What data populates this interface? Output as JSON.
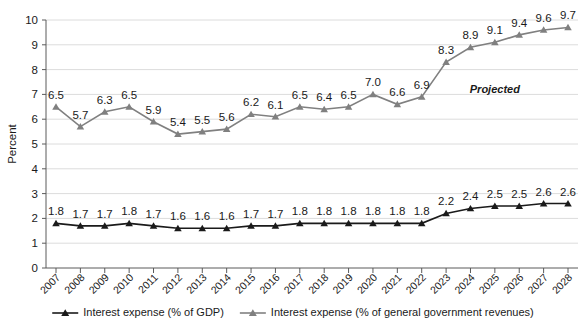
{
  "chart_data": {
    "type": "line",
    "title": "",
    "xlabel": "",
    "ylabel": "Percent",
    "ylim": [
      0,
      10
    ],
    "yticks": [
      "0",
      "1",
      "2",
      "3",
      "4",
      "5",
      "6",
      "7",
      "8",
      "9",
      "10"
    ],
    "grid": true,
    "legend_position": "bottom",
    "categories": [
      "2007",
      "2008",
      "2009",
      "2010",
      "2011",
      "2012",
      "2013",
      "2014",
      "2015",
      "2016",
      "2017",
      "2018",
      "2019",
      "2020",
      "2021",
      "2022",
      "2023",
      "2024",
      "2025",
      "2026",
      "2027",
      "2028"
    ],
    "series": [
      {
        "name": "Interest expense (% of GDP)",
        "color": "#1a1a1a",
        "marker": "triangle",
        "values": [
          1.8,
          1.7,
          1.7,
          1.8,
          1.7,
          1.6,
          1.6,
          1.6,
          1.7,
          1.7,
          1.8,
          1.8,
          1.8,
          1.8,
          1.8,
          1.8,
          2.2,
          2.4,
          2.5,
          2.5,
          2.6,
          2.6
        ],
        "labels": [
          "1.8",
          "1.7",
          "1.7",
          "1.8",
          "1.7",
          "1.6",
          "1.6",
          "1.6",
          "1.7",
          "1.7",
          "1.8",
          "1.8",
          "1.8",
          "1.8",
          "1.8",
          "1.8",
          "2.2",
          "2.4",
          "2.5",
          "2.5",
          "2.6",
          "2.6"
        ]
      },
      {
        "name": "Interest expense (% of general government revenues)",
        "color": "#808080",
        "marker": "triangle",
        "values": [
          6.5,
          5.7,
          6.3,
          6.5,
          5.9,
          5.4,
          5.5,
          5.6,
          6.2,
          6.1,
          6.5,
          6.4,
          6.5,
          7.0,
          6.6,
          6.9,
          8.3,
          8.9,
          9.1,
          9.4,
          9.6,
          9.7
        ],
        "labels": [
          "6.5",
          "5.7",
          "6.3",
          "6.5",
          "5.9",
          "5.4",
          "5.5",
          "5.6",
          "6.2",
          "6.1",
          "6.5",
          "6.4",
          "6.5",
          "7.0",
          "6.6",
          "6.9",
          "8.3",
          "8.9",
          "9.1",
          "9.4",
          "9.6",
          "9.7"
        ]
      }
    ],
    "annotations": [
      {
        "text": "Projected",
        "x_category": "2025",
        "y_value": 7.05
      }
    ]
  },
  "legend": {
    "items": [
      {
        "label": "Interest expense (% of GDP)",
        "color": "#1a1a1a"
      },
      {
        "label": "Interest expense (% of general government revenues)",
        "color": "#808080"
      }
    ]
  }
}
